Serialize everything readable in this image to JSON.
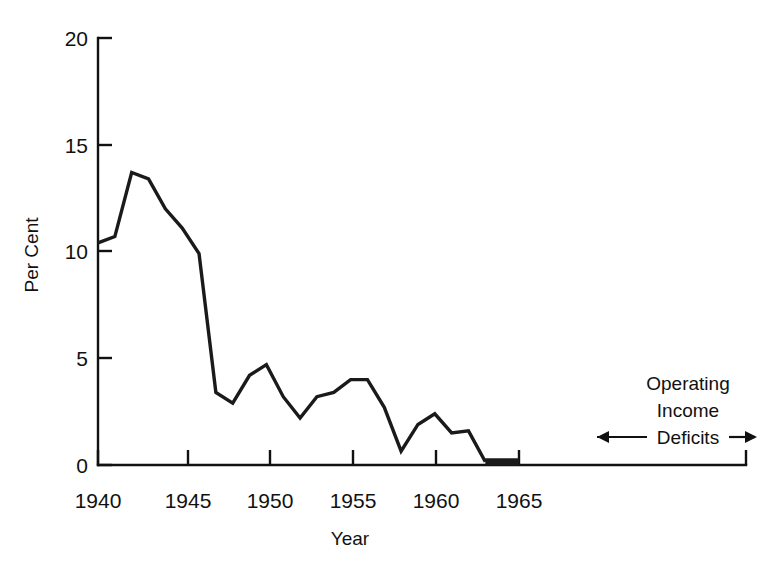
{
  "chart_data": {
    "type": "line",
    "title": "",
    "xlabel": "Year",
    "ylabel": "Per Cent",
    "xlim": [
      1940,
      1968.5
    ],
    "ylim": [
      0,
      20
    ],
    "grid": false,
    "legend": null,
    "x_ticks": [
      1940,
      1945,
      1950,
      1955,
      1960,
      1965
    ],
    "x_tick_labels": [
      "1940",
      "1945",
      "1950",
      "1955",
      "1960",
      "1965"
    ],
    "y_ticks": [
      0,
      5,
      10,
      15,
      20
    ],
    "y_tick_labels": [
      "0",
      "5",
      "10",
      "15",
      "20"
    ],
    "x": [
      1940,
      1941,
      1942,
      1943,
      1944,
      1945,
      1946,
      1947,
      1948,
      1949,
      1950,
      1951,
      1952,
      1953,
      1954,
      1955,
      1956,
      1957,
      1958,
      1959,
      1960,
      1961,
      1962,
      1963,
      1964,
      1965
    ],
    "values": [
      10.4,
      10.7,
      13.7,
      13.4,
      12.0,
      11.1,
      9.9,
      3.4,
      2.9,
      4.2,
      4.7,
      3.2,
      2.2,
      3.2,
      3.4,
      4.0,
      4.0,
      2.7,
      0.65,
      1.9,
      2.4,
      1.5,
      1.6,
      0.15,
      0.15,
      0.15
    ],
    "annotations": [
      {
        "lines": [
          "Operating",
          "Income",
          "Deficits"
        ],
        "arrow_left": true,
        "arrow_right": true
      }
    ]
  },
  "axes": {
    "y_title": "Per Cent",
    "x_title": "Year"
  },
  "annotation": {
    "line1": "Operating",
    "line2": "Income",
    "line3": "Deficits"
  },
  "colors": {
    "line": "#1a1a1a",
    "axis": "#111111",
    "background": "#ffffff"
  }
}
